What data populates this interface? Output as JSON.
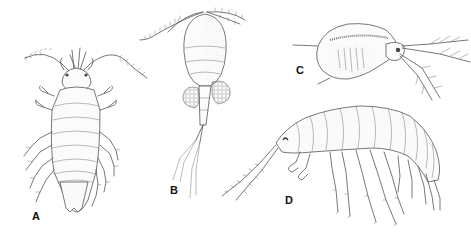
{
  "figure": {
    "panels": [
      {
        "label": "A",
        "subject": "isopod",
        "label_pos": {
          "x": 32,
          "y": 211
        }
      },
      {
        "label": "B",
        "subject": "copepod",
        "label_pos": {
          "x": 170,
          "y": 185
        }
      },
      {
        "label": "C",
        "subject": "cladoceran",
        "label_pos": {
          "x": 296,
          "y": 65
        }
      },
      {
        "label": "D",
        "subject": "amphipod",
        "label_pos": {
          "x": 285,
          "y": 195
        }
      }
    ],
    "colors": {
      "background": "#ffffff",
      "ink": "#555555",
      "label": "#111111"
    }
  }
}
